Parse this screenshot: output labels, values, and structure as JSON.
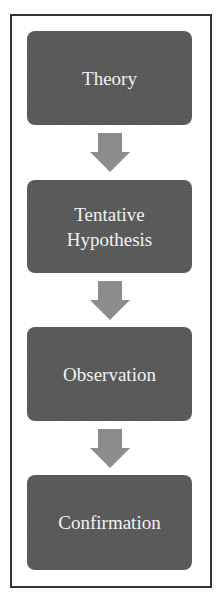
{
  "diagram": {
    "type": "vertical-flowchart",
    "colors": {
      "box_fill": "#595959",
      "box_text": "#f2f2f2",
      "arrow_fill": "#8c8c8c",
      "frame_border": "#333333",
      "background": "#ffffff"
    },
    "steps": [
      {
        "label": "Theory"
      },
      {
        "label": "Tentative\nHypothesis",
        "lines": [
          "Tentative",
          "Hypothesis"
        ]
      },
      {
        "label": "Observation"
      },
      {
        "label": "Confirmation"
      }
    ],
    "connectors": [
      {
        "from": "Theory",
        "to": "Tentative Hypothesis",
        "icon": "down-arrow-icon"
      },
      {
        "from": "Tentative Hypothesis",
        "to": "Observation",
        "icon": "down-arrow-icon"
      },
      {
        "from": "Observation",
        "to": "Confirmation",
        "icon": "down-arrow-icon"
      }
    ]
  }
}
